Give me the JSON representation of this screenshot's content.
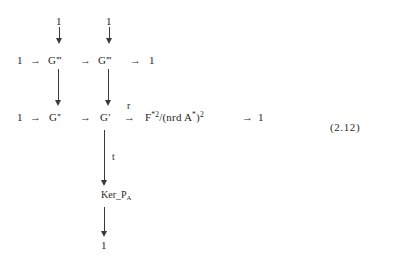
{
  "document": {
    "type": "commutative-diagram",
    "equation_number": "(2.12)",
    "background_color": "#ffffff",
    "ink_color": "#2b2b2b"
  },
  "rows": {
    "row0": {
      "left_terminal": "1",
      "right_terminal": "1"
    },
    "row1": {
      "start": "1",
      "arrow1": "→",
      "term1_base": "G",
      "term1_primes": "'''",
      "arrow2": "→",
      "term2_base": "G",
      "term2_primes": "'''",
      "arrow3": "→",
      "end": "1"
    },
    "row2": {
      "start": "1",
      "arrow1": "→",
      "term1_base": "G",
      "term1_primes": "''",
      "arrow2": "→",
      "term2_base": "G",
      "term2_primes": "'",
      "arrow3": "→",
      "arrow3_label": "r",
      "quotient_num_base": "F",
      "quotient_num_sup": "*2",
      "slash": "/(nrd A",
      "denom_sup_star": "*",
      "denom_close": ")",
      "denom_sup_two": "2",
      "arrow4": "→",
      "end": "1"
    },
    "row3": {
      "label": "t"
    },
    "row4": {
      "ker_text": "Ker",
      "p_symbol": "P",
      "p_subscript": "A",
      "underline": "_"
    },
    "row5": {
      "terminal": "1"
    }
  }
}
